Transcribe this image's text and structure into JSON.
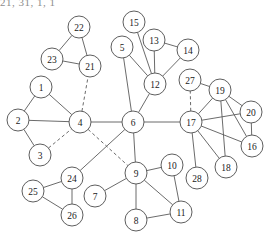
{
  "figure": {
    "width": 269,
    "height": 232,
    "background_color": "#ffffff",
    "node_fill_color": "#ffffff",
    "node_stroke_color": "#555555",
    "edge_color": "#5a5a5a",
    "label_color": "#1a1a1a",
    "node_radius": 11,
    "artifact_text": "21, 31, 1, 1 ..."
  },
  "graph_data": {
    "type": "node-link-diagram",
    "directed": false,
    "node_count": 28,
    "edge_count": 41,
    "nodes": [
      {
        "id": "1",
        "label": "1",
        "x": 41,
        "y": 87
      },
      {
        "id": "2",
        "label": "2",
        "x": 18,
        "y": 120
      },
      {
        "id": "3",
        "label": "3",
        "x": 40,
        "y": 155
      },
      {
        "id": "4",
        "label": "4",
        "x": 80,
        "y": 122
      },
      {
        "id": "5",
        "label": "5",
        "x": 122,
        "y": 47
      },
      {
        "id": "6",
        "label": "6",
        "x": 133,
        "y": 122
      },
      {
        "id": "7",
        "label": "7",
        "x": 95,
        "y": 196
      },
      {
        "id": "8",
        "label": "8",
        "x": 136,
        "y": 220
      },
      {
        "id": "9",
        "label": "9",
        "x": 136,
        "y": 173
      },
      {
        "id": "10",
        "label": "10",
        "x": 172,
        "y": 165
      },
      {
        "id": "11",
        "label": "11",
        "x": 181,
        "y": 212
      },
      {
        "id": "12",
        "label": "12",
        "x": 155,
        "y": 84
      },
      {
        "id": "13",
        "label": "13",
        "x": 154,
        "y": 40
      },
      {
        "id": "14",
        "label": "14",
        "x": 188,
        "y": 50
      },
      {
        "id": "15",
        "label": "15",
        "x": 134,
        "y": 22
      },
      {
        "id": "16",
        "label": "16",
        "x": 252,
        "y": 146
      },
      {
        "id": "17",
        "label": "17",
        "x": 191,
        "y": 122
      },
      {
        "id": "18",
        "label": "18",
        "x": 226,
        "y": 167
      },
      {
        "id": "19",
        "label": "19",
        "x": 220,
        "y": 90
      },
      {
        "id": "20",
        "label": "20",
        "x": 251,
        "y": 112
      },
      {
        "id": "21",
        "label": "21",
        "x": 90,
        "y": 66
      },
      {
        "id": "22",
        "label": "22",
        "x": 79,
        "y": 27
      },
      {
        "id": "23",
        "label": "23",
        "x": 52,
        "y": 59
      },
      {
        "id": "24",
        "label": "24",
        "x": 72,
        "y": 178
      },
      {
        "id": "25",
        "label": "25",
        "x": 33,
        "y": 191
      },
      {
        "id": "26",
        "label": "26",
        "x": 72,
        "y": 215
      },
      {
        "id": "27",
        "label": "27",
        "x": 190,
        "y": 80
      },
      {
        "id": "28",
        "label": "28",
        "x": 197,
        "y": 178
      }
    ],
    "edges": [
      {
        "source": "1",
        "target": "2",
        "style": "solid"
      },
      {
        "source": "1",
        "target": "4",
        "style": "solid"
      },
      {
        "source": "2",
        "target": "4",
        "style": "solid"
      },
      {
        "source": "2",
        "target": "3",
        "style": "solid"
      },
      {
        "source": "3",
        "target": "4",
        "style": "dashed"
      },
      {
        "source": "4",
        "target": "6",
        "style": "solid"
      },
      {
        "source": "4",
        "target": "21",
        "style": "dashed"
      },
      {
        "source": "4",
        "target": "9",
        "style": "dashed"
      },
      {
        "source": "21",
        "target": "22",
        "style": "solid"
      },
      {
        "source": "21",
        "target": "23",
        "style": "solid"
      },
      {
        "source": "22",
        "target": "23",
        "style": "solid"
      },
      {
        "source": "5",
        "target": "6",
        "style": "solid"
      },
      {
        "source": "5",
        "target": "12",
        "style": "solid"
      },
      {
        "source": "6",
        "target": "12",
        "style": "solid"
      },
      {
        "source": "6",
        "target": "9",
        "style": "solid"
      },
      {
        "source": "6",
        "target": "17",
        "style": "solid"
      },
      {
        "source": "6",
        "target": "24",
        "style": "solid"
      },
      {
        "source": "12",
        "target": "13",
        "style": "solid"
      },
      {
        "source": "12",
        "target": "14",
        "style": "solid"
      },
      {
        "source": "12",
        "target": "15",
        "style": "solid"
      },
      {
        "source": "13",
        "target": "14",
        "style": "solid"
      },
      {
        "source": "24",
        "target": "25",
        "style": "solid"
      },
      {
        "source": "24",
        "target": "26",
        "style": "solid"
      },
      {
        "source": "25",
        "target": "26",
        "style": "solid"
      },
      {
        "source": "7",
        "target": "9",
        "style": "solid"
      },
      {
        "source": "9",
        "target": "8",
        "style": "solid"
      },
      {
        "source": "9",
        "target": "10",
        "style": "solid"
      },
      {
        "source": "9",
        "target": "11",
        "style": "solid"
      },
      {
        "source": "8",
        "target": "11",
        "style": "solid"
      },
      {
        "source": "10",
        "target": "11",
        "style": "solid"
      },
      {
        "source": "17",
        "target": "19",
        "style": "solid"
      },
      {
        "source": "17",
        "target": "20",
        "style": "solid"
      },
      {
        "source": "17",
        "target": "16",
        "style": "solid"
      },
      {
        "source": "17",
        "target": "18",
        "style": "solid"
      },
      {
        "source": "17",
        "target": "28",
        "style": "solid"
      },
      {
        "source": "17",
        "target": "27",
        "style": "dashed"
      },
      {
        "source": "19",
        "target": "20",
        "style": "solid"
      },
      {
        "source": "19",
        "target": "16",
        "style": "solid"
      },
      {
        "source": "19",
        "target": "18",
        "style": "solid"
      },
      {
        "source": "19",
        "target": "27",
        "style": "solid"
      },
      {
        "source": "20",
        "target": "16",
        "style": "solid"
      }
    ]
  }
}
